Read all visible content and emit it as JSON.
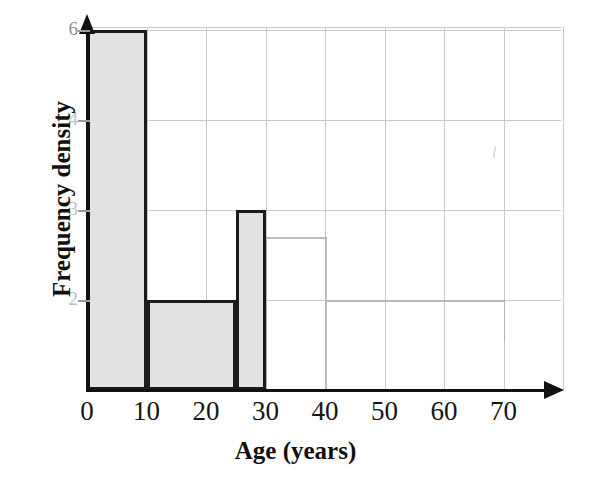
{
  "chart_data": {
    "type": "bar",
    "title": "",
    "subtitle": "",
    "xlabel": "Age (years)",
    "ylabel": "Frequency density",
    "xlim": [
      0,
      80
    ],
    "ylim": [
      0,
      6.5
    ],
    "grid": true,
    "legend": null,
    "x_tick_labels": [
      "0",
      "10",
      "20",
      "30",
      "40",
      "50",
      "60",
      "70"
    ],
    "x_tick_values": [
      0,
      10,
      20,
      30,
      40,
      50,
      60,
      70
    ],
    "y_tick_labels": [
      "6",
      "4",
      "3",
      "2"
    ],
    "y_tick_values": [
      6,
      4,
      3,
      2
    ],
    "y_gridline_values": [
      6,
      4.5,
      3,
      1.5
    ],
    "bin_edges": [
      0,
      10,
      25,
      30
    ],
    "bars": [
      {
        "label": "0-10",
        "x_start": 0,
        "x_end": 10,
        "frequency_density": 6,
        "frequency": 60,
        "drawn": true
      },
      {
        "label": "10-25",
        "x_start": 10,
        "x_end": 25,
        "frequency_density": 1.5,
        "frequency": 22.5,
        "drawn": true
      },
      {
        "label": "25-30",
        "x_start": 25,
        "x_end": 30,
        "frequency_density": 3,
        "frequency": 15,
        "drawn": true
      }
    ],
    "pencil_marks": [
      {
        "label": "faint-bar-30-40",
        "x_start": 30,
        "x_end": 40,
        "frequency_density": 2.55
      },
      {
        "label": "faint-line-40-70",
        "x_start": 40,
        "x_end": 70,
        "frequency_density": 1.5
      },
      {
        "label": "faint-scribble-top-right",
        "x": 68,
        "y": 4.1,
        "glyph": "\\\\"
      }
    ],
    "values": [
      6,
      1.5,
      3
    ],
    "categories": [
      "0-10",
      "10-25",
      "25-30"
    ]
  },
  "style": {
    "bar_fill": "#e2e2e2",
    "bar_stroke": "#1a1a1a",
    "grid_color": "#c9c9cf",
    "axis_color": "#111111",
    "pencil_color": "#b3b3b3",
    "background": "#ffffff"
  }
}
